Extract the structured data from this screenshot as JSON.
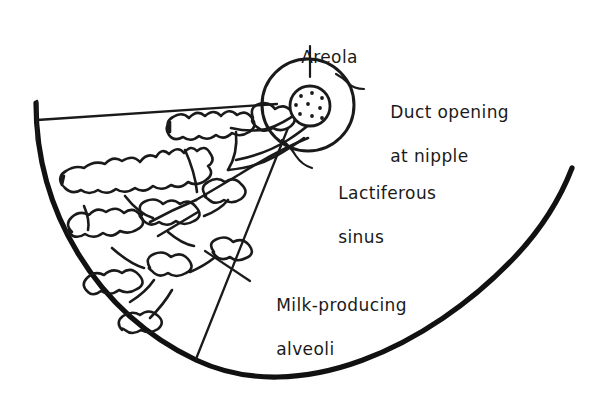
{
  "figure": {
    "background_color": "#ffffff",
    "ink_color": "#1a1a1a",
    "labels": [
      {
        "id": "areola",
        "text": "Areola",
        "text2": ""
      },
      {
        "id": "duct",
        "text": "Duct opening",
        "text2": "at nipple"
      },
      {
        "id": "sinus",
        "text": "Lactiferous",
        "text2": "sinus"
      },
      {
        "id": "alveoli",
        "text": "Milk-producing",
        "text2": "alveoli"
      }
    ],
    "structures": [
      {
        "name": "areola-circle",
        "description": "large outer circle at nipple"
      },
      {
        "name": "nipple-circle",
        "description": "small stippled circle with duct openings"
      },
      {
        "name": "duct-openings",
        "count": 9
      },
      {
        "name": "lactiferous-duct",
        "description": "tapering duct bundle to nipple"
      },
      {
        "name": "alveoli-cluster",
        "description": "branching lobular gland tissue"
      },
      {
        "name": "breast-outline",
        "description": "thick curved chest-wall arc"
      }
    ]
  }
}
